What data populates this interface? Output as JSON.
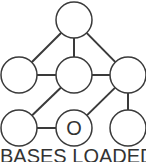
{
  "diagram": {
    "title": "BASES LOADED",
    "colors": {
      "stroke": "#3a3a3a",
      "fill": "#ffffff",
      "text": "#333333"
    },
    "nodes": [
      {
        "id": "top",
        "cx": 74,
        "cy": 20,
        "r": 18,
        "label": ""
      },
      {
        "id": "mid-left",
        "cx": 19,
        "cy": 75,
        "r": 18,
        "label": ""
      },
      {
        "id": "mid-center",
        "cx": 74,
        "cy": 75,
        "r": 18,
        "label": ""
      },
      {
        "id": "mid-right",
        "cx": 128,
        "cy": 75,
        "r": 18,
        "label": ""
      },
      {
        "id": "bot-left",
        "cx": 19,
        "cy": 128,
        "r": 18,
        "label": ""
      },
      {
        "id": "bot-center",
        "cx": 74,
        "cy": 128,
        "r": 18,
        "label": "O"
      },
      {
        "id": "bot-right",
        "cx": 128,
        "cy": 128,
        "r": 18,
        "label": ""
      }
    ],
    "edges": [
      [
        "top",
        "mid-left"
      ],
      [
        "top",
        "mid-center"
      ],
      [
        "top",
        "mid-right"
      ],
      [
        "mid-left",
        "mid-center"
      ],
      [
        "mid-center",
        "mid-right"
      ],
      [
        "mid-center",
        "bot-left"
      ],
      [
        "mid-right",
        "bot-center"
      ],
      [
        "mid-right",
        "bot-right"
      ],
      [
        "bot-left",
        "bot-center"
      ]
    ]
  }
}
